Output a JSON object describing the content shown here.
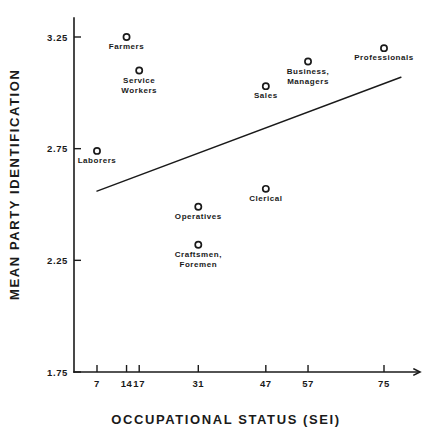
{
  "chart_data": {
    "type": "scatter",
    "title": "",
    "xlabel": "OCCUPATIONAL STATUS (SEI)",
    "ylabel": "MEAN PARTY IDENTIFICATION",
    "xlim": [
      0,
      82
    ],
    "ylim": [
      1.75,
      3.25
    ],
    "grid": false,
    "legend": "none",
    "xticks": [
      7,
      14,
      17,
      31,
      47,
      57,
      75
    ],
    "xtick_labels": [
      "7",
      "14",
      "17",
      "31",
      "47",
      "57",
      "75"
    ],
    "yticks": [
      1.75,
      2.25,
      2.75,
      3.25
    ],
    "ytick_labels": [
      "1.75",
      "2.25",
      "2.75",
      "3.25"
    ],
    "marker_symbol": "open-circle",
    "points": [
      {
        "label": "Farmers",
        "x": 14,
        "y": 3.25,
        "label_lines": [
          "Farmers"
        ],
        "label_pos": "below"
      },
      {
        "label": "Service Workers",
        "x": 17,
        "y": 3.1,
        "label_lines": [
          "Service",
          "Workers"
        ],
        "label_pos": "below"
      },
      {
        "label": "Laborers",
        "x": 7,
        "y": 2.74,
        "label_lines": [
          "Laborers"
        ],
        "label_pos": "below"
      },
      {
        "label": "Operatives",
        "x": 31,
        "y": 2.49,
        "label_lines": [
          "Operatives"
        ],
        "label_pos": "below"
      },
      {
        "label": "Craftsmen, Foremen",
        "x": 31,
        "y": 2.32,
        "label_lines": [
          "Craftsmen,",
          "Foremen"
        ],
        "label_pos": "below"
      },
      {
        "label": "Clerical",
        "x": 47,
        "y": 2.57,
        "label_lines": [
          "Clerical"
        ],
        "label_pos": "below"
      },
      {
        "label": "Sales",
        "x": 47,
        "y": 3.03,
        "label_lines": [
          "Sales"
        ],
        "label_pos": "below"
      },
      {
        "label": "Business, Managers",
        "x": 57,
        "y": 3.14,
        "label_lines": [
          "Business,",
          "Managers"
        ],
        "label_pos": "below"
      },
      {
        "label": "Professionals",
        "x": 75,
        "y": 3.2,
        "label_lines": [
          "Professionals"
        ],
        "label_pos": "below"
      }
    ],
    "trend_line": {
      "type": "regression",
      "x_start": 7,
      "y_start": 2.56,
      "x_end": 79,
      "y_end": 3.07
    },
    "colors": {
      "ink": "#1a1a1a",
      "background": "#ffffff"
    }
  },
  "ticks": {
    "x": [
      {
        "value": 7,
        "label": "7"
      },
      {
        "value": 14,
        "label": "14"
      },
      {
        "value": 17,
        "label": "17"
      },
      {
        "value": 31,
        "label": "31"
      },
      {
        "value": 47,
        "label": "47"
      },
      {
        "value": 57,
        "label": "57"
      },
      {
        "value": 75,
        "label": "75"
      }
    ],
    "y": [
      {
        "value": 3.25,
        "label": "3.25"
      },
      {
        "value": 2.75,
        "label": "2.75"
      },
      {
        "value": 2.25,
        "label": "2.25"
      },
      {
        "value": 1.75,
        "label": "1.75"
      }
    ]
  }
}
